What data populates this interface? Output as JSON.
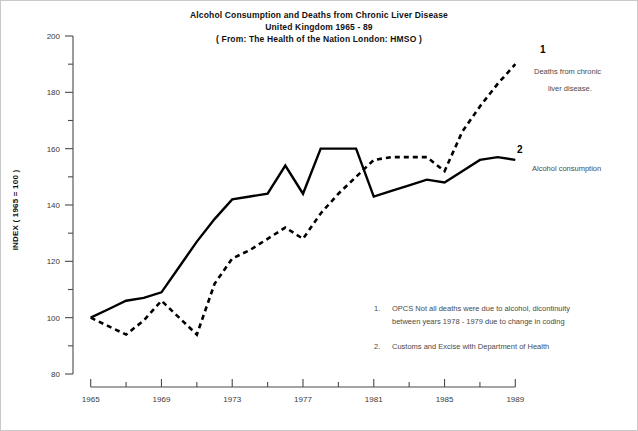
{
  "chart_data": {
    "type": "line",
    "title": "Alcohol Consumption and Deaths from Chronic Liver Disease",
    "subtitle": "United Kingdom 1965 - 89",
    "source_line": "( From: The Health of the Nation London: HMSO )",
    "xlabel": "",
    "ylabel": "INDEX ( 1965 = 100 )",
    "xlim": [
      1964,
      1990
    ],
    "ylim": [
      80,
      200
    ],
    "yticks": [
      80,
      100,
      120,
      140,
      160,
      180,
      200
    ],
    "ytick_labels": [
      "80",
      "100",
      "120",
      "140",
      "160",
      "180",
      "200"
    ],
    "yminor_step": 10,
    "xticks": [
      1965,
      1967,
      1969,
      1971,
      1973,
      1975,
      1977,
      1979,
      1981,
      1983,
      1985,
      1987,
      1989
    ],
    "xtick_labels": [
      "1965",
      "",
      "1969",
      "",
      "1973",
      "",
      "1977",
      "",
      "1981",
      "",
      "1985",
      "",
      "1989"
    ],
    "grid": false,
    "legend_position": "right-inline",
    "x": [
      1965,
      1966,
      1967,
      1968,
      1969,
      1970,
      1971,
      1972,
      1973,
      1974,
      1975,
      1976,
      1977,
      1978,
      1979,
      1980,
      1981,
      1982,
      1983,
      1984,
      1985,
      1986,
      1987,
      1988,
      1989
    ],
    "series": [
      {
        "name": "Deaths from chronic liver disease.",
        "marker": "1",
        "style": "dashed",
        "color": "#000000",
        "values": [
          100,
          97,
          94,
          99,
          106,
          100,
          94,
          112,
          121,
          124,
          128,
          132,
          128,
          137,
          144,
          150,
          156,
          157,
          157,
          157,
          152,
          166,
          175,
          183,
          190
        ]
      },
      {
        "name": "Alcohol consumption",
        "marker": "2",
        "style": "solid",
        "color": "#000000",
        "values": [
          100,
          103,
          106,
          107,
          109,
          118,
          127,
          135,
          142,
          143,
          144,
          154,
          144,
          160,
          160,
          160,
          143,
          145,
          147,
          149,
          148,
          152,
          156,
          157,
          156
        ]
      }
    ],
    "notes": [
      {
        "number": "1.",
        "lines": [
          "OPCS  Not all deaths were due to alcohol, dicontinuity",
          "between years 1978 - 1979 due to change in coding"
        ]
      },
      {
        "number": "2.",
        "lines": [
          "Customs and Excise with Department of Health"
        ]
      }
    ]
  }
}
